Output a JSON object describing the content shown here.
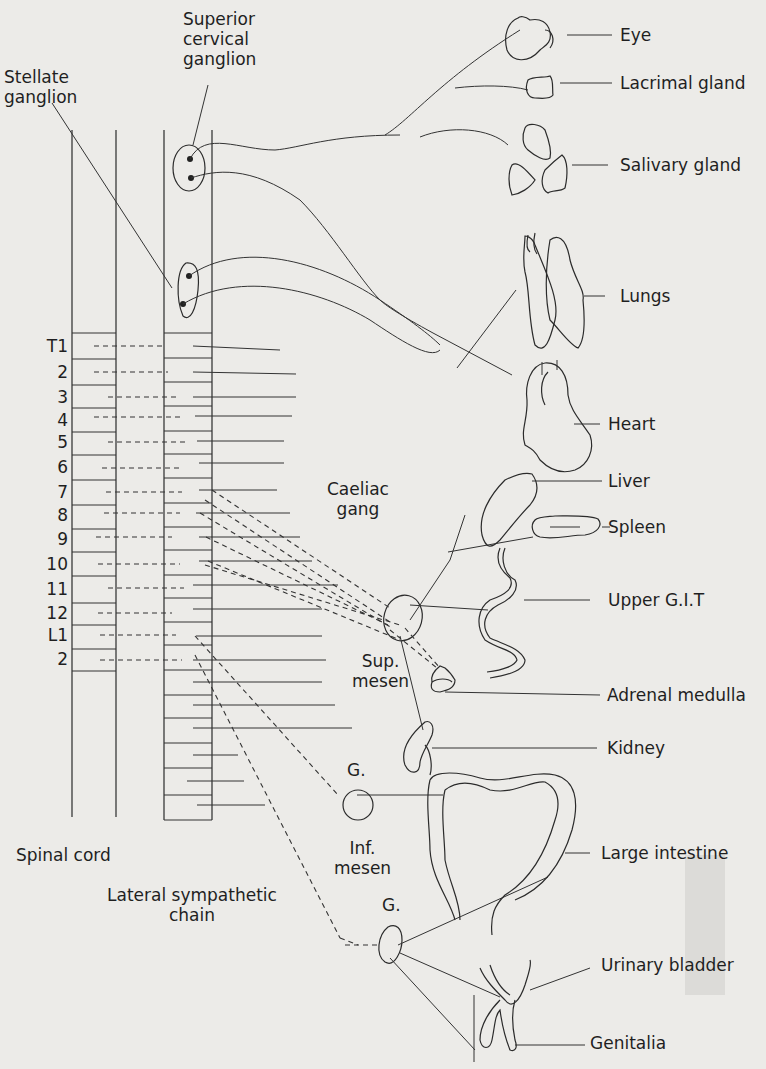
{
  "diagram": {
    "colors": {
      "background": "#ecebe8",
      "ink": "#2b2b2b"
    }
  },
  "labels": {
    "superior_cervical_ganglion": "Superior\ncervical\nganglion",
    "stellate_ganglion": "Stellate\nganglion",
    "caeliac_gang": "Caeliac\ngang",
    "sup_mesen": "Sup.\nmesen",
    "g_upper": "G.",
    "inf_mesen": "Inf.\nmesen",
    "g_lower": "G.",
    "spinal_cord": "Spinal cord",
    "lateral_sympathetic_chain": "Lateral sympathetic\nchain"
  },
  "segments": [
    "T1",
    "2",
    "3",
    "4",
    "5",
    "6",
    "7",
    "8",
    "9",
    "10",
    "11",
    "12",
    "L1",
    "2"
  ],
  "organs": [
    {
      "id": "eye",
      "label": "Eye"
    },
    {
      "id": "lacrimal",
      "label": "Lacrimal gland"
    },
    {
      "id": "salivary",
      "label": "Salivary gland"
    },
    {
      "id": "lungs",
      "label": "Lungs"
    },
    {
      "id": "heart",
      "label": "Heart"
    },
    {
      "id": "liver",
      "label": "Liver"
    },
    {
      "id": "spleen",
      "label": "Spleen"
    },
    {
      "id": "upper_git",
      "label": "Upper G.I.T"
    },
    {
      "id": "adrenal",
      "label": "Adrenal medulla"
    },
    {
      "id": "kidney",
      "label": "Kidney"
    },
    {
      "id": "large_intestine",
      "label": "Large intestine"
    },
    {
      "id": "urinary_bladder",
      "label": "Urinary bladder"
    },
    {
      "id": "genitalia",
      "label": "Genitalia"
    }
  ]
}
